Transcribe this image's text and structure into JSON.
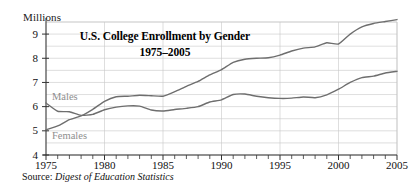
{
  "chart_data": {
    "type": "line",
    "title": "U.S. College Enrollment by Gender",
    "subtitle": "1975–2005",
    "ylabel": "Millions",
    "xlabel": "",
    "xlim": [
      1975,
      2005
    ],
    "ylim": [
      4,
      9.5
    ],
    "grid": true,
    "legend_position": "inline-on-plot",
    "yticks": [
      "4",
      "5",
      "6",
      "7",
      "8",
      "9"
    ],
    "ytick_values": [
      4,
      5,
      6,
      7,
      8,
      9
    ],
    "xticks": [
      "1975",
      "1980",
      "1985",
      "1990",
      "1995",
      "2000",
      "2005"
    ],
    "xtick_values": [
      1975,
      1980,
      1985,
      1990,
      1995,
      2000,
      2005
    ],
    "x": [
      1975,
      1976,
      1977,
      1978,
      1979,
      1980,
      1981,
      1982,
      1983,
      1984,
      1985,
      1986,
      1987,
      1988,
      1989,
      1990,
      1991,
      1992,
      1993,
      1994,
      1995,
      1996,
      1997,
      1998,
      1999,
      2000,
      2001,
      2002,
      2003,
      2004,
      2005
    ],
    "series": [
      {
        "name": "Males",
        "color": "#6e6e6e",
        "values": [
          6.15,
          5.81,
          5.79,
          5.64,
          5.68,
          5.87,
          5.98,
          6.03,
          6.02,
          5.86,
          5.82,
          5.88,
          5.93,
          6.0,
          6.19,
          6.28,
          6.5,
          6.52,
          6.43,
          6.37,
          6.34,
          6.35,
          6.4,
          6.37,
          6.49,
          6.72,
          7.0,
          7.2,
          7.26,
          7.39,
          7.46
        ],
        "label_text": "Males"
      },
      {
        "name": "Females",
        "color": "#6e6e6e",
        "values": [
          5.04,
          5.2,
          5.46,
          5.62,
          5.89,
          6.22,
          6.41,
          6.43,
          6.47,
          6.45,
          6.43,
          6.62,
          6.84,
          7.04,
          7.31,
          7.53,
          7.83,
          7.96,
          8.0,
          8.02,
          8.13,
          8.3,
          8.42,
          8.47,
          8.64,
          8.59,
          9.0,
          9.3,
          9.44,
          9.52,
          9.6
        ],
        "label_text": "Females"
      }
    ],
    "source_prefix": "Source:",
    "source_value": "Digest of Education Statistics",
    "colors": {
      "line": "#6e6e6e",
      "grid": "#c8c8c8",
      "axis": "#333333",
      "text": "#111111",
      "series_label": "#8e8e8e"
    }
  }
}
